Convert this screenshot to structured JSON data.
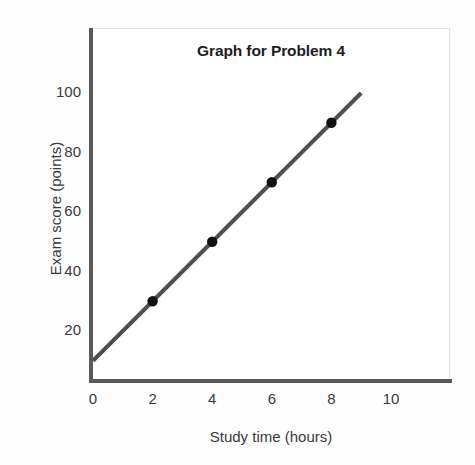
{
  "chart_data": {
    "type": "line",
    "title": "Graph for Problem 4",
    "xlabel": "Study time (hours)",
    "ylabel": "Exam score (points)",
    "xlim": [
      0,
      12
    ],
    "ylim": [
      0,
      118
    ],
    "xticks": [
      0,
      2,
      4,
      6,
      8,
      10
    ],
    "xtick_labels": [
      "0",
      "2",
      "4",
      "6",
      "8",
      "10"
    ],
    "yticks": [
      20,
      40,
      60,
      80,
      100
    ],
    "ytick_labels": [
      "20",
      "40",
      "60",
      "80",
      "100"
    ],
    "grid": false,
    "legend": null,
    "series": [
      {
        "name": "Exam score vs study time",
        "type": "line",
        "color": "#4f4f4f",
        "line_width": 4,
        "x": [
          0,
          9
        ],
        "y": [
          10,
          100
        ],
        "marker_color": "#111111",
        "markers": {
          "x": [
            2,
            4,
            6,
            8
          ],
          "y": [
            30,
            50,
            70,
            90
          ]
        }
      }
    ],
    "points": [
      {
        "x": 2,
        "y": 30
      },
      {
        "x": 4,
        "y": 50
      },
      {
        "x": 6,
        "y": 70
      },
      {
        "x": 8,
        "y": 90
      }
    ],
    "line_fit": {
      "slope": 10,
      "intercept": 10,
      "x_start": 0,
      "x_end": 9,
      "y_start": 10,
      "y_end": 100
    },
    "colors": {
      "line": "#4f4f4f",
      "marker": "#111111",
      "axis": "#5a5a5a",
      "frame": "#e2e2e2",
      "text": "#3a3a3a",
      "title": "#1d1d1d",
      "background": "#ffffff"
    }
  }
}
